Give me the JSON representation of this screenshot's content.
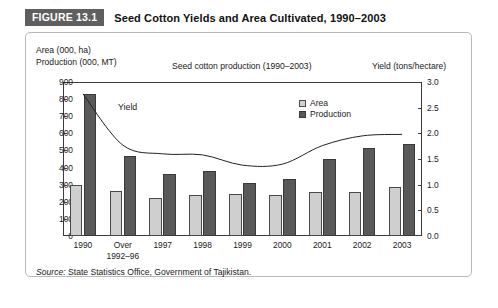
{
  "figure": {
    "badge": "FIGURE 13.1",
    "title": "Seed Cotton Yields and Area Cultivated, 1990–2003"
  },
  "source": {
    "label": "Source:",
    "text": "State Statistics Office, Government of Tajikistan."
  },
  "legend": {
    "items": [
      {
        "label": "Area",
        "color": "#cfcfcf"
      },
      {
        "label": "Production",
        "color": "#595959"
      }
    ]
  },
  "annotations": {
    "yield_label": "Yield"
  },
  "chart_data": {
    "type": "bar",
    "title": "Seed cotton production (1990–2003)",
    "left_axis_caption_line1": "Area (000, ha)",
    "left_axis_caption_line2": "Production (000, MT)",
    "right_axis_caption": "Yield (tons/hectare)",
    "categories": [
      "1990",
      "Over\n1992–96",
      "1997",
      "1998",
      "1999",
      "2000",
      "2001",
      "2002",
      "2003"
    ],
    "category_labels": [
      [
        "1990",
        ""
      ],
      [
        "Over",
        "1992–96"
      ],
      [
        "1997",
        ""
      ],
      [
        "1998",
        ""
      ],
      [
        "1999",
        ""
      ],
      [
        "2000",
        ""
      ],
      [
        "2001",
        ""
      ],
      [
        "2002",
        ""
      ],
      [
        "2003",
        ""
      ]
    ],
    "series": [
      {
        "name": "Area",
        "axis": "left",
        "type": "bar",
        "color": "#cfcfcf",
        "values": [
          300,
          265,
          225,
          240,
          245,
          240,
          255,
          260,
          285
        ]
      },
      {
        "name": "Production",
        "axis": "left",
        "type": "bar",
        "color": "#595959",
        "values": [
          830,
          470,
          360,
          380,
          310,
          335,
          450,
          515,
          535
        ]
      },
      {
        "name": "Yield",
        "axis": "right",
        "type": "line",
        "color": "#222222",
        "values": [
          2.77,
          1.77,
          1.6,
          1.58,
          1.38,
          1.4,
          1.76,
          1.95,
          1.98
        ]
      }
    ],
    "ylabel": "Area (000, ha) / Production (000, MT)",
    "ylim": [
      0,
      900
    ],
    "yticks": [
      900,
      800,
      700,
      600,
      500,
      400,
      300,
      200,
      100,
      0
    ],
    "y2label": "Yield (tons/hectare)",
    "y2lim": [
      0,
      3.0
    ],
    "y2ticks": [
      "3.0",
      "2.5",
      "2.0",
      "1.5",
      "1.0",
      "0.5",
      "0.0"
    ],
    "xlabel": "",
    "grid": false,
    "legend_position": "inside-top-center"
  }
}
